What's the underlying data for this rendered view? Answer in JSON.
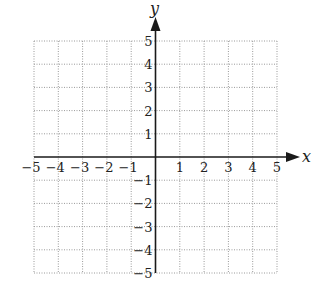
{
  "chart_data": {
    "type": "coordinate-grid",
    "title": "",
    "xlabel": "x",
    "ylabel": "y",
    "xlim": [
      -5,
      5
    ],
    "ylim": [
      -5,
      5
    ],
    "grid": true,
    "grid_step": 1,
    "x_ticks": [
      -5,
      -4,
      -3,
      -2,
      -1,
      1,
      2,
      3,
      4,
      5
    ],
    "y_ticks": [
      5,
      4,
      3,
      2,
      1,
      -1,
      -2,
      -3,
      -4,
      -5
    ],
    "series": []
  },
  "axes": {
    "x_label": "x",
    "y_label": "y",
    "x_tick_labels": [
      "−5",
      "−4",
      "−3",
      "−2",
      "−1",
      "1",
      "2",
      "3",
      "4",
      "5"
    ],
    "y_tick_labels": [
      "5",
      "4",
      "3",
      "2",
      "1",
      "−1",
      "−2",
      "−3",
      "−4",
      "−5"
    ]
  },
  "colors": {
    "axis": "#1a1a1a",
    "grid": "#9a9a9a",
    "background": "#ffffff"
  }
}
